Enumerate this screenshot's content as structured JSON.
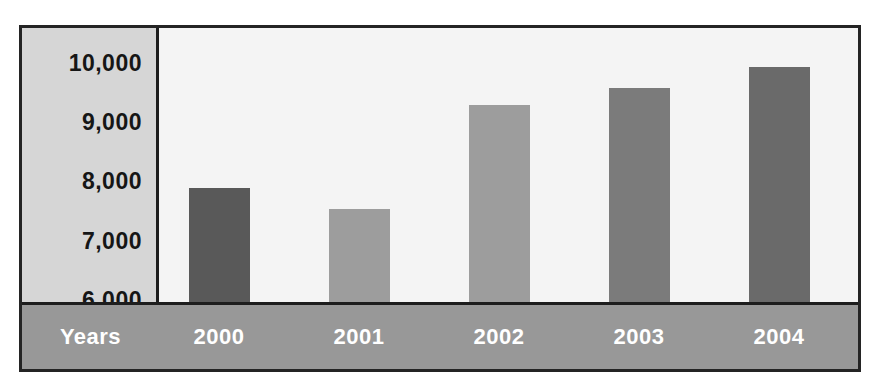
{
  "chart_data": {
    "type": "bar",
    "title": "",
    "xlabel": "Years",
    "ylabel": "",
    "categories": [
      "2000",
      "2001",
      "2002",
      "2003",
      "2004"
    ],
    "values": [
      7840,
      7420,
      9490,
      9830,
      10250
    ],
    "ytick_labels": [
      "10,000",
      "9,000",
      "8,000",
      "7,000",
      "6,000"
    ],
    "ytick_values": [
      10000,
      9000,
      8000,
      7000,
      6000
    ],
    "ylim": [
      5510,
      11020
    ],
    "grid": false,
    "legend": null,
    "bar_colors": [
      "#595959",
      "#9d9d9d",
      "#9d9d9d",
      "#7b7b7b",
      "#6a6a6a"
    ]
  },
  "style": {
    "frame_border_color": "#242424",
    "axis_panel_color": "#d6d6d6",
    "plot_background": "#f4f4f4",
    "axis_band_color": "#989898",
    "axis_band_text_color": "#ffffff",
    "tick_text_color": "#161616"
  }
}
